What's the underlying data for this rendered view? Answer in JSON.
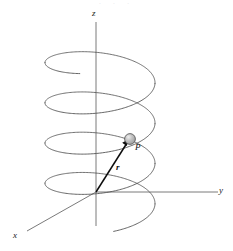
{
  "figure": {
    "background_color": "#ffffff",
    "width": 233,
    "height": 251,
    "top_caption_fragment": "· · ·"
  },
  "axes": {
    "z_label": "z",
    "y_label": "y",
    "x_label": "x",
    "color": "#6b6b6b",
    "stroke_width": 0.9,
    "origin": {
      "x": 96,
      "y": 192
    },
    "z_axis": {
      "x1": 96,
      "y1": 22,
      "x2": 96,
      "y2": 226
    },
    "y_axis": {
      "x1": 96,
      "y1": 192,
      "x2": 218,
      "y2": 192
    },
    "x_axis": {
      "x1": 96,
      "y1": 192,
      "x2": 27,
      "y2": 231
    }
  },
  "helix": {
    "name": "helix-curve",
    "color": "#4a4a4a",
    "stroke_width": 0.85,
    "center_x": 100,
    "semi_axis_x": 55,
    "semi_axis_y": 20,
    "turns": 3.9,
    "top_y": 55,
    "bottom_y": 212,
    "left_extent": 45,
    "right_extent": 155
  },
  "point_p": {
    "label": "P",
    "marker_name": "sphere-marker",
    "x": 130,
    "y": 139,
    "radius": 5.5,
    "fill_color": "#b8b8b8",
    "highlight_color": "#e0e0e0",
    "stroke_color": "#4d4d4d"
  },
  "vector_r": {
    "label": "r",
    "description": "position vector from origin to P",
    "color": "#0d0d0d",
    "stroke_width": 1.5,
    "from": {
      "x": 96,
      "y": 192
    },
    "to": {
      "x": 127,
      "y": 143
    },
    "arrowhead": true
  },
  "chart_data": {
    "type": "line",
    "xlabel": "x",
    "ylabel": "y",
    "zlabel": "z",
    "projection": "3d-oblique",
    "grid": false,
    "legend": false,
    "series": [
      {
        "name": "helix",
        "parametric": "(a cos t, a sin t, c t)",
        "t_range": [
          0,
          24.5
        ],
        "turns": 3.9,
        "radius": 55,
        "vertical_extent_px": 157
      },
      {
        "name": "position-vector-r",
        "points": [
          [
            96,
            192
          ],
          [
            130,
            139
          ]
        ],
        "label": "r"
      },
      {
        "name": "point-P",
        "points": [
          [
            130,
            139
          ]
        ],
        "label": "P"
      }
    ],
    "annotations": [
      "z",
      "y",
      "x",
      "P",
      "r"
    ]
  }
}
